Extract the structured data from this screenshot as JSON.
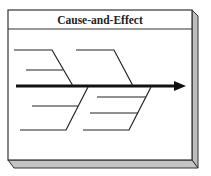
{
  "diagram": {
    "title": "Cause-and-Effect",
    "type": "fishbone",
    "colors": {
      "frame_face": "#ffffff",
      "frame_border": "#333333",
      "frame_shadow": "#bdbdbd",
      "lines": "#222222"
    },
    "bones": [
      {
        "position": "upper-left",
        "sub_lines": 2
      },
      {
        "position": "upper-right",
        "sub_lines": 1
      },
      {
        "position": "lower-left",
        "sub_lines": 2
      },
      {
        "position": "lower-right",
        "sub_lines": 3
      }
    ],
    "spine": {
      "direction": "right",
      "arrow": true
    }
  }
}
